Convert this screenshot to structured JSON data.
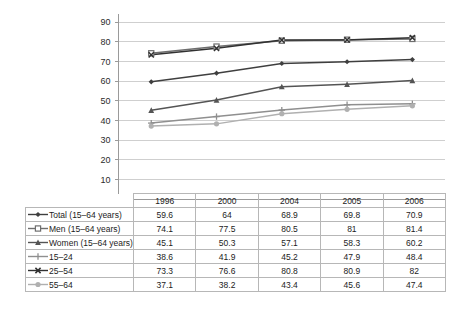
{
  "chart_data": {
    "type": "line",
    "title": "",
    "subtitle": "",
    "xlabel": "",
    "ylabel": "",
    "categories": [
      "1996",
      "2000",
      "2004",
      "2005",
      "2006"
    ],
    "ylim": [
      0,
      90
    ],
    "ytick_step": 10,
    "yticks": [
      "90",
      "80",
      "70",
      "60",
      "50",
      "40",
      "30",
      "20",
      "10",
      "0"
    ],
    "grid": true,
    "legend_position": "table-left-column",
    "series": [
      {
        "name": "Total (15–64 years)",
        "marker": "filled-diamond",
        "color": "#3f3f3f",
        "values": [
          59.6,
          64,
          68.9,
          69.8,
          70.9
        ],
        "labels": [
          "59.6",
          "64",
          "68.9",
          "69.8",
          "70.9"
        ]
      },
      {
        "name": "Men (15–64 years)",
        "marker": "open-square",
        "color": "#6e6e6e",
        "values": [
          74.1,
          77.5,
          80.5,
          81,
          81.4
        ],
        "labels": [
          "74.1",
          "77.5",
          "80.5",
          "81",
          "81.4"
        ]
      },
      {
        "name": "Women (15–64 years)",
        "marker": "filled-triangle",
        "color": "#545454",
        "values": [
          45.1,
          50.3,
          57.1,
          58.3,
          60.2
        ],
        "labels": [
          "45.1",
          "50.3",
          "57.1",
          "58.3",
          "60.2"
        ]
      },
      {
        "name": "15–24",
        "marker": "cross-plus",
        "color": "#8f8f8f",
        "values": [
          38.6,
          41.9,
          45.2,
          47.9,
          48.4
        ],
        "labels": [
          "38.6",
          "41.9",
          "45.2",
          "47.9",
          "48.4"
        ]
      },
      {
        "name": "25–54",
        "marker": "x-mark",
        "color": "#313131",
        "values": [
          73.3,
          76.6,
          80.8,
          80.9,
          82
        ],
        "labels": [
          "73.3",
          "76.6",
          "80.8",
          "80.9",
          "82"
        ]
      },
      {
        "name": "55–64",
        "marker": "filled-circle",
        "color": "#b0b0b0",
        "values": [
          37.1,
          38.2,
          43.4,
          45.6,
          47.4
        ],
        "labels": [
          "37.1",
          "38.2",
          "43.4",
          "45.6",
          "47.4"
        ]
      }
    ]
  },
  "table": {
    "corner_label": "",
    "column_headers": [
      "1996",
      "2000",
      "2004",
      "2005",
      "2006"
    ],
    "rows": [
      {
        "label": "Total (15–64 years)",
        "marker": "filled-diamond",
        "values": [
          "59.6",
          "64",
          "68.9",
          "69.8",
          "70.9"
        ]
      },
      {
        "label": "Men (15–64 years)",
        "marker": "open-square",
        "values": [
          "74.1",
          "77.5",
          "80.5",
          "81",
          "81.4"
        ]
      },
      {
        "label": "Women (15–64 years)",
        "marker": "filled-triangle",
        "values": [
          "45.1",
          "50.3",
          "57.1",
          "58.3",
          "60.2"
        ]
      },
      {
        "label": "15–24",
        "marker": "cross-plus",
        "values": [
          "38.6",
          "41.9",
          "45.2",
          "47.9",
          "48.4"
        ]
      },
      {
        "label": "25–54",
        "marker": "x-mark",
        "values": [
          "73.3",
          "76.6",
          "80.8",
          "80.9",
          "82"
        ]
      },
      {
        "label": "55–64",
        "marker": "filled-circle",
        "values": [
          "37.1",
          "38.2",
          "43.4",
          "45.6",
          "47.4"
        ]
      }
    ]
  },
  "colors": {
    "grid": "#cfcfcf",
    "axis": "#9a9a9a",
    "border": "#b7b7b7",
    "text": "#1c1c1c",
    "background": "#ffffff"
  }
}
